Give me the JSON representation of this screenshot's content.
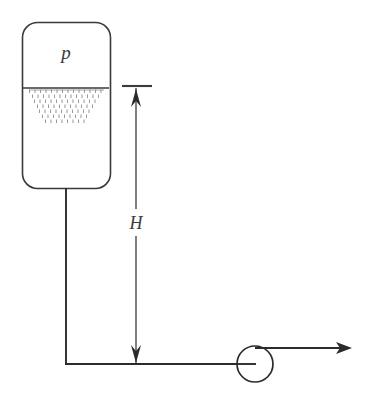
{
  "figure": {
    "kind": "engineering-schematic",
    "background_color": "#ffffff",
    "line_color": "#3a3a3a",
    "pipe_color": "#2b2b2b",
    "hatch_color": "#9a9a9a"
  },
  "labels": {
    "pressure": "p",
    "height": "H"
  },
  "tank": {
    "name": "pressurized-tank",
    "x": 22,
    "y": 22,
    "width": 88,
    "height": 166,
    "corner_radius": 15,
    "liquid_surface_y": 88
  },
  "liquid": {
    "surface_line": {
      "x1": 23,
      "x2": 109,
      "y": 88
    },
    "hatch_rows": [
      {
        "y": 91,
        "x_start": 29,
        "x_end": 104,
        "dash_count": 14
      },
      {
        "y": 96,
        "x_start": 32,
        "x_end": 101,
        "dash_count": 13
      },
      {
        "y": 101,
        "x_start": 34,
        "x_end": 99,
        "dash_count": 12
      },
      {
        "y": 106,
        "x_start": 37,
        "x_end": 96,
        "dash_count": 11
      },
      {
        "y": 111,
        "x_start": 39,
        "x_end": 94,
        "dash_count": 10
      },
      {
        "y": 116,
        "x_start": 42,
        "x_end": 91,
        "dash_count": 9
      },
      {
        "y": 121,
        "x_start": 45,
        "x_end": 88,
        "dash_count": 8
      }
    ]
  },
  "pipe": {
    "vertical": {
      "x": 66,
      "y_top": 188,
      "y_bottom": 364
    },
    "horizontal": {
      "y": 364,
      "x_left": 66,
      "x_right": 255
    },
    "outlet": {
      "y": 348,
      "x_left": 255,
      "x_right": 350
    },
    "outlet_arrow": {
      "tip_x": 352,
      "y": 348
    }
  },
  "valve": {
    "name": "discharge-valve",
    "center_x": 255,
    "center_y": 364,
    "radius": 18,
    "stem": {
      "x1": 237,
      "x2": 255,
      "y": 364
    }
  },
  "dimension": {
    "name": "height-dimension-H",
    "x": 136,
    "y_top": 86,
    "y_bottom": 364,
    "tick": {
      "x1": 122,
      "x2": 152,
      "y": 86
    },
    "label_gap": {
      "y_start": 208,
      "y_end": 236
    },
    "label_y": 228,
    "arrow_top_points": "136,90 131,106 136,101 141,106",
    "arrow_bottom_points": "136,362 131,344 136,349 141,344"
  }
}
